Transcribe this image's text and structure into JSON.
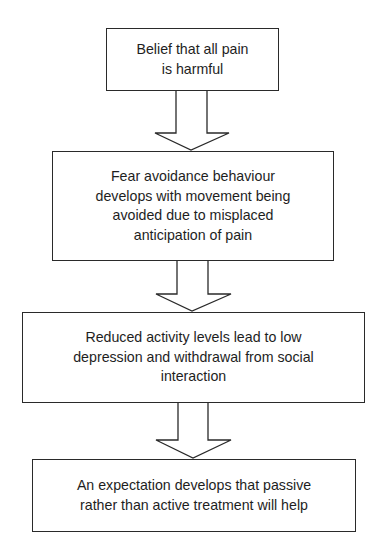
{
  "diagram": {
    "type": "flowchart",
    "direction": "top-to-bottom",
    "steps": [
      {
        "id": "step1",
        "label": "Belief that all pain is harmful",
        "lines": [
          "Belief that all pain",
          "is harmful"
        ]
      },
      {
        "id": "step2",
        "label": "Fear avoidance behaviour develops with movement being avoided due to misplaced anticipation of pain",
        "lines": [
          "Fear avoidance behaviour",
          "develops with movement being",
          "avoided due to misplaced",
          "anticipation of pain"
        ]
      },
      {
        "id": "step3",
        "label": "Reduced activity levels lead to low depression and withdrawal from social interaction",
        "lines": [
          "Reduced activity levels lead to low",
          "depression and withdrawal from social",
          "interaction"
        ]
      },
      {
        "id": "step4",
        "label": "An expectation develops that passive rather than active treatment will help",
        "lines": [
          "An expectation develops that passive",
          "rather than active treatment will help"
        ]
      }
    ],
    "connectors": [
      {
        "from": "step1",
        "to": "step2",
        "style": "block-arrow-down"
      },
      {
        "from": "step2",
        "to": "step3",
        "style": "block-arrow-down"
      },
      {
        "from": "step3",
        "to": "step4",
        "style": "block-arrow-down"
      }
    ],
    "colors": {
      "stroke": "#2a2a2a",
      "fill": "#ffffff",
      "text": "#1e1e1e",
      "background": "#ffffff"
    }
  }
}
